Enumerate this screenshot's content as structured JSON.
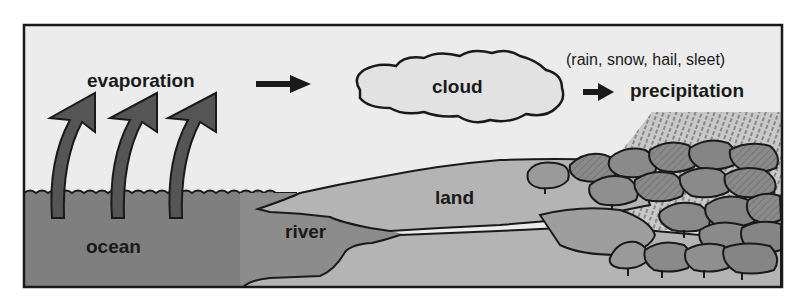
{
  "diagram": {
    "labels": {
      "evaporation": "evaporation",
      "cloud": "cloud",
      "precipitation_types": "(rain, snow, hail, sleet)",
      "precipitation": "precipitation",
      "land": "land",
      "river": "river",
      "ocean": "ocean"
    },
    "colors": {
      "sky": "#ececec",
      "ocean": "#7f7f7f",
      "land": "#b4b4b4",
      "river": "#8c8c8c",
      "cloud": "#e2e2e2",
      "arrow": "#555555",
      "trees": "#8a8a8a",
      "outline": "#1a1a1a"
    },
    "icons": {
      "evaporation_arrows": "curved-up-arrow-icon",
      "flow_arrow": "right-arrow-icon"
    }
  }
}
